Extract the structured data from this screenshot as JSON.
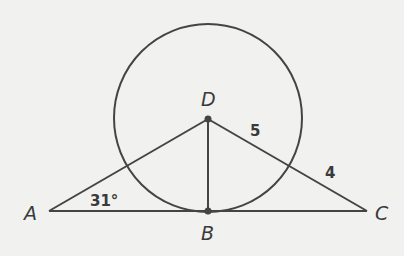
{
  "diagram": {
    "type": "geometry",
    "colors": {
      "stroke": "#444444",
      "background": "#f1f1ef",
      "text": "#3a3a3a"
    },
    "points": {
      "A": {
        "label": "A",
        "x": 49,
        "y": 211
      },
      "B": {
        "label": "B",
        "x": 208,
        "y": 211
      },
      "C": {
        "label": "C",
        "x": 367,
        "y": 211
      },
      "D": {
        "label": "D",
        "x": 208,
        "y": 118
      }
    },
    "circle": {
      "center": "D",
      "radius": 94
    },
    "segments": [
      "AC",
      "AD",
      "DC",
      "DB"
    ],
    "measures": {
      "angle_A": "31°",
      "DC_inner": "5",
      "DC_outer": "4"
    }
  }
}
